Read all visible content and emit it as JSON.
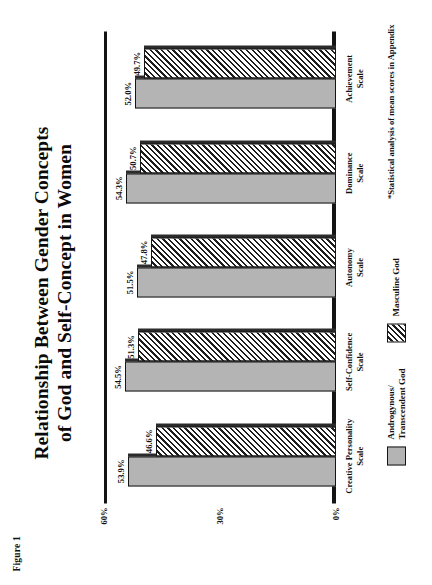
{
  "figure_label": "Figure 1",
  "title": {
    "line1": "Relationship Between Gender Concepts",
    "line2": "of God and Self-Concept in Women"
  },
  "footnote": "*Statistical analysis of mean scores in Appendix",
  "legend": {
    "items": [
      {
        "label_line1": "Androgynous/",
        "label_line2": "Transcendent God",
        "swatch": "solid-gray",
        "color": "#b4b4b4"
      },
      {
        "label_line1": "Masculine God",
        "label_line2": "",
        "swatch": "diagonal-hatch",
        "color": "#ffffff"
      }
    ]
  },
  "chart_data": {
    "type": "bar",
    "title": "Relationship Between Gender Concepts of God and Self-Concept in Women",
    "xlabel": "",
    "ylabel": "",
    "ylim": [
      0,
      60
    ],
    "yticks": [
      0,
      30,
      60
    ],
    "ytick_labels": [
      "0%",
      "30%",
      "60%"
    ],
    "grid": false,
    "legend_position": "bottom-left",
    "categories": [
      "Creative Personality Scale",
      "Self-Confidence Scale",
      "Autonomy Scale",
      "Dominance Scale",
      "Achievement Scale"
    ],
    "category_lines": [
      {
        "name": "Creative Personality",
        "sub": "Scale"
      },
      {
        "name": "Self-Confidence",
        "sub": "Scale"
      },
      {
        "name": "Autonomy",
        "sub": "Scale"
      },
      {
        "name": "Dominance",
        "sub": "Scale"
      },
      {
        "name": "Achievement",
        "sub": "Scale"
      }
    ],
    "series": [
      {
        "name": "Androgynous/Transcendent God",
        "values": [
          53.9,
          54.5,
          51.5,
          54.3,
          52.0
        ],
        "labels": [
          "53.9%",
          "54.5%",
          "51.5%",
          "54.3%",
          "52.0%"
        ]
      },
      {
        "name": "Masculine God",
        "values": [
          46.6,
          51.3,
          47.8,
          50.7,
          49.7
        ],
        "labels": [
          "46.6%",
          "51.3%",
          "47.8%",
          "50.7%",
          "49.7%"
        ]
      }
    ]
  }
}
